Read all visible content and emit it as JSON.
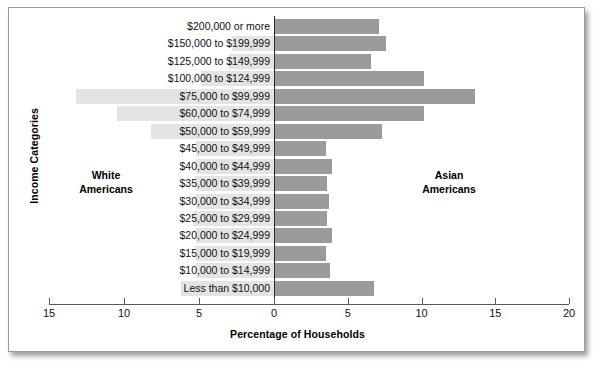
{
  "chart_data": {
    "type": "bar",
    "subtype": "population-pyramid",
    "title": "",
    "xlabel": "Percentage of Households",
    "ylabel": "Income Categories",
    "xlim": [
      -15,
      20
    ],
    "x_ticks": [
      {
        "label": "15",
        "value": -15
      },
      {
        "label": "10",
        "value": -10
      },
      {
        "label": "5",
        "value": -5
      },
      {
        "label": "0",
        "value": 0
      },
      {
        "label": "5",
        "value": 5
      },
      {
        "label": "10",
        "value": 10
      },
      {
        "label": "15",
        "value": 15
      },
      {
        "label": "20",
        "value": 20
      }
    ],
    "grid": false,
    "legend_position": "inline-annotations",
    "annotations": [
      {
        "name": "left-group",
        "text": "White\nAmericans",
        "line1": "White",
        "line2": "Americans"
      },
      {
        "name": "right-group",
        "text": "Asian\nAmericans",
        "line1": "Asian",
        "line2": "Americans"
      }
    ],
    "categories": [
      "$200,000 or more",
      "$150,000 to $199,999",
      "$125,000 to $149,999",
      "$100,000 to $124,999",
      "$75,000 to $99,999",
      "$60,000 to $74,999",
      "$50,000 to $59,999",
      "$45,000 to $49,999",
      "$40,000 to $44,999",
      "$35,000 to $39,999",
      "$30,000 to $34,999",
      "$25,000 to $29,999",
      "$20,000 to $24,999",
      "$15,000 to $19,999",
      "$10,000 to $14,999",
      "Less than $10,000"
    ],
    "series": [
      {
        "name": "White Americans",
        "side": "left",
        "color": "#e4e4e4",
        "values": [
          0.0,
          2.8,
          3.0,
          4.9,
          13.2,
          10.5,
          8.2,
          5.2,
          5.2,
          5.3,
          5.2,
          5.4,
          5.2,
          5.2,
          5.2,
          6.2
        ]
      },
      {
        "name": "Asian Americans",
        "side": "right",
        "color": "#9b9b9b",
        "values": [
          7.1,
          7.6,
          6.6,
          10.2,
          13.6,
          10.2,
          7.3,
          3.5,
          3.9,
          3.6,
          3.7,
          3.6,
          3.9,
          3.5,
          3.8,
          6.8
        ]
      }
    ]
  },
  "axis": {
    "x_title": "Percentage of Households",
    "y_title": "Income Categories"
  },
  "groups": {
    "left": {
      "line1": "White",
      "line2": "Americans"
    },
    "right": {
      "line1": "Asian",
      "line2": "Americans"
    }
  },
  "colors": {
    "left_bar": "#e4e4e4",
    "right_bar": "#9b9b9b",
    "axis": "#5a5a5a",
    "zero_line": "#2b2b2b",
    "frame": "#9b9b9b",
    "text": "#111111"
  }
}
